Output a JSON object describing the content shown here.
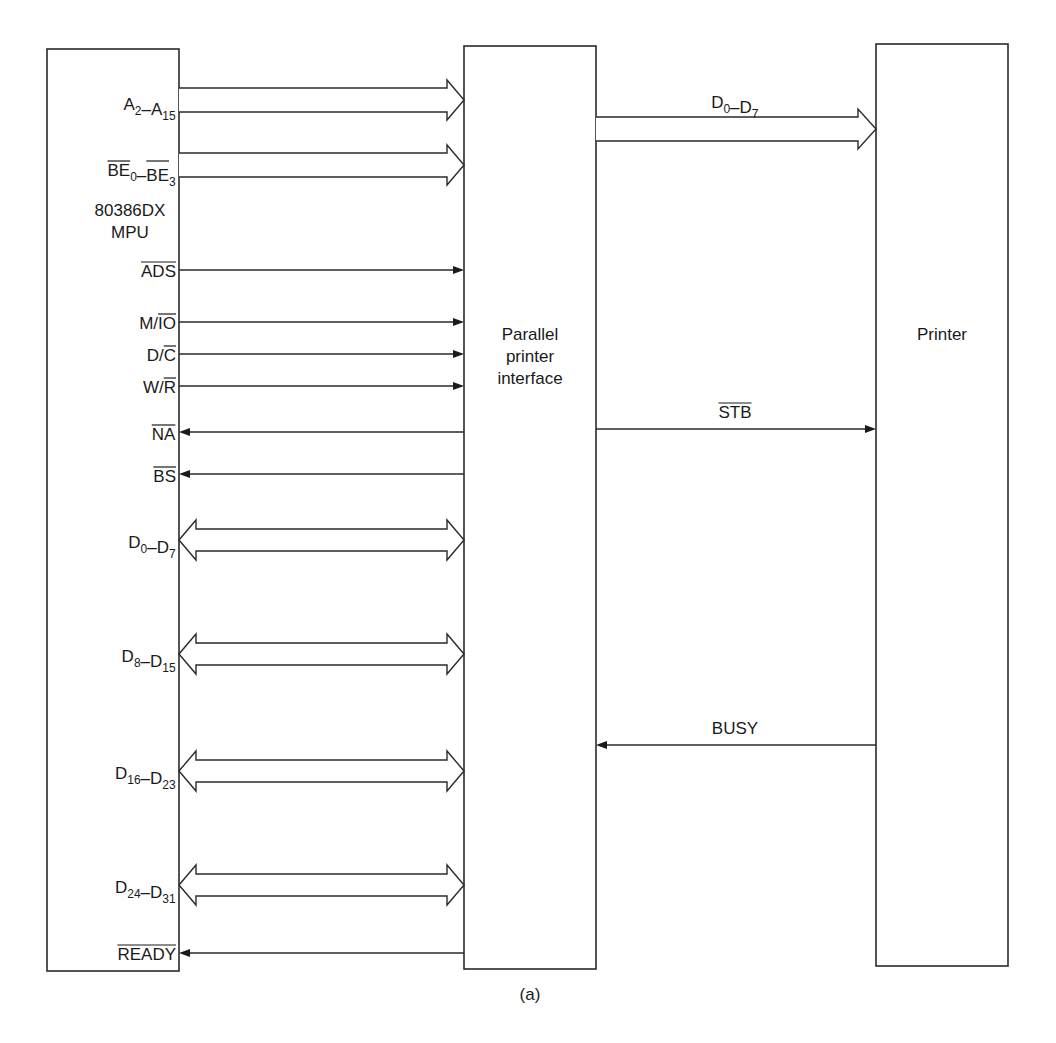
{
  "figure": {
    "caption": "(a)",
    "blocks": {
      "mpu": {
        "lines": [
          "80386DX",
          "MPU"
        ]
      },
      "interface": {
        "lines": [
          "Parallel",
          "printer",
          "interface"
        ]
      },
      "printer": {
        "lines": [
          "Printer"
        ]
      }
    },
    "mpu_signals": [
      {
        "id": "address-bus",
        "type": "bus",
        "direction": "out",
        "segments": [
          {
            "t": "A"
          },
          {
            "t": "2",
            "sub": true
          },
          {
            "t": "–A"
          },
          {
            "t": "15",
            "sub": true
          }
        ]
      },
      {
        "id": "byte-enable-bus",
        "type": "bus",
        "direction": "out",
        "segments": [
          {
            "t": "BE",
            "over": true
          },
          {
            "t": "0",
            "sub": true
          },
          {
            "t": "–"
          },
          {
            "t": "BE",
            "over": true
          },
          {
            "t": "3",
            "sub": true
          }
        ]
      },
      {
        "id": "ads",
        "type": "line",
        "direction": "out",
        "segments": [
          {
            "t": "ADS",
            "over": true
          }
        ]
      },
      {
        "id": "m-io",
        "type": "line",
        "direction": "out",
        "segments": [
          {
            "t": "M/"
          },
          {
            "t": "IO",
            "over": true
          }
        ]
      },
      {
        "id": "d-c",
        "type": "line",
        "direction": "out",
        "segments": [
          {
            "t": "D/"
          },
          {
            "t": "C",
            "over": true
          }
        ]
      },
      {
        "id": "w-r",
        "type": "line",
        "direction": "out",
        "segments": [
          {
            "t": "W/"
          },
          {
            "t": "R",
            "over": true
          }
        ]
      },
      {
        "id": "na",
        "type": "line",
        "direction": "in",
        "segments": [
          {
            "t": "NA",
            "over": true
          }
        ]
      },
      {
        "id": "bs",
        "type": "line",
        "direction": "in",
        "segments": [
          {
            "t": "BS",
            "over": true
          }
        ]
      },
      {
        "id": "data-bus-0-7",
        "type": "bus",
        "direction": "bidirectional",
        "segments": [
          {
            "t": "D"
          },
          {
            "t": "0",
            "sub": true
          },
          {
            "t": "–D"
          },
          {
            "t": "7",
            "sub": true
          }
        ]
      },
      {
        "id": "data-bus-8-15",
        "type": "bus",
        "direction": "bidirectional",
        "segments": [
          {
            "t": "D"
          },
          {
            "t": "8",
            "sub": true
          },
          {
            "t": "–D"
          },
          {
            "t": "15",
            "sub": true
          }
        ]
      },
      {
        "id": "data-bus-16-23",
        "type": "bus",
        "direction": "bidirectional",
        "segments": [
          {
            "t": "D"
          },
          {
            "t": "16",
            "sub": true
          },
          {
            "t": "–D"
          },
          {
            "t": "23",
            "sub": true
          }
        ]
      },
      {
        "id": "data-bus-24-31",
        "type": "bus",
        "direction": "bidirectional",
        "segments": [
          {
            "t": "D"
          },
          {
            "t": "24",
            "sub": true
          },
          {
            "t": "–D"
          },
          {
            "t": "31",
            "sub": true
          }
        ]
      },
      {
        "id": "ready",
        "type": "line",
        "direction": "in",
        "segments": [
          {
            "t": "READY",
            "over": true
          }
        ]
      }
    ],
    "printer_signals": [
      {
        "id": "printer-data-bus",
        "type": "bus",
        "direction": "out",
        "segments": [
          {
            "t": "D"
          },
          {
            "t": "0",
            "sub": true
          },
          {
            "t": "–D"
          },
          {
            "t": "7",
            "sub": true
          }
        ]
      },
      {
        "id": "strobe",
        "type": "line",
        "direction": "out",
        "segments": [
          {
            "t": "STB",
            "over": true
          }
        ]
      },
      {
        "id": "busy",
        "type": "line",
        "direction": "in",
        "segments": [
          {
            "t": "BUSY"
          }
        ]
      }
    ]
  }
}
